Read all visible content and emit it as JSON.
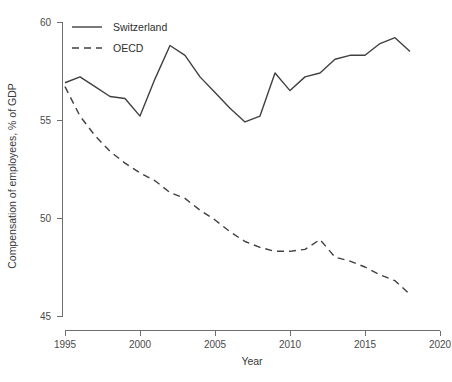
{
  "chart_data": {
    "type": "line",
    "title": "",
    "xlabel": "Year",
    "ylabel": "Compensation of employees, % of GDP",
    "xlim": [
      1995,
      2020
    ],
    "ylim": [
      45,
      60
    ],
    "xticks": [
      1995,
      2000,
      2005,
      2010,
      2015,
      2020
    ],
    "xtick_labels": [
      "1995",
      "2000",
      "2005",
      "2010",
      "2015",
      "2020"
    ],
    "yticks": [
      45,
      50,
      55,
      60
    ],
    "ytick_labels": [
      "45",
      "50",
      "55",
      "60"
    ],
    "grid": false,
    "legend_position": "top-left",
    "x": [
      1995,
      1996,
      1997,
      1998,
      1999,
      2000,
      2001,
      2002,
      2003,
      2004,
      2005,
      2006,
      2007,
      2008,
      2009,
      2010,
      2011,
      2012,
      2013,
      2014,
      2015,
      2016,
      2017,
      2018
    ],
    "series": [
      {
        "name": "Switzerland",
        "style": "solid",
        "color": "#404040",
        "values": [
          56.9,
          57.2,
          56.7,
          56.2,
          56.1,
          55.2,
          57.1,
          58.8,
          58.3,
          57.2,
          56.4,
          55.6,
          54.9,
          55.2,
          57.4,
          56.5,
          57.2,
          57.4,
          58.1,
          58.3,
          58.3,
          58.9,
          59.2,
          58.5
        ]
      },
      {
        "name": "OECD",
        "style": "dashed",
        "color": "#404040",
        "values": [
          56.7,
          55.2,
          54.2,
          53.4,
          52.8,
          52.3,
          51.9,
          51.3,
          51.0,
          50.4,
          49.9,
          49.3,
          48.8,
          48.5,
          48.3,
          48.3,
          48.4,
          48.9,
          48.0,
          47.8,
          47.5,
          47.1,
          46.8,
          46.1
        ]
      }
    ],
    "legend": [
      {
        "label": "Switzerland",
        "style": "solid"
      },
      {
        "label": "OECD",
        "style": "dashed"
      }
    ]
  }
}
